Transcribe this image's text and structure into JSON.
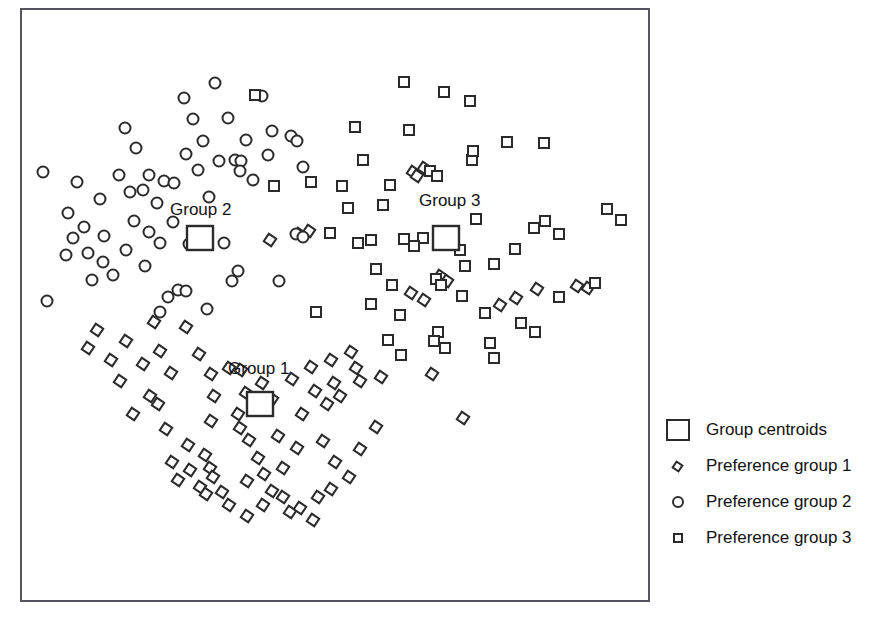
{
  "chart_data": {
    "type": "scatter",
    "title": "",
    "xlabel": "",
    "ylabel": "",
    "grid": false,
    "axis_ticks": false,
    "frame": {
      "x": 20,
      "y": 8,
      "width": 630,
      "height": 594
    },
    "xlim": [
      20,
      650
    ],
    "ylim": [
      8,
      602
    ],
    "marker_colors": {
      "stroke": "#2b2b2b",
      "fill": "#ffffff"
    },
    "annotations": [
      {
        "text": "Group 1",
        "x": 228,
        "y": 368
      },
      {
        "text": "Group 2",
        "x": 170,
        "y": 209
      },
      {
        "text": "Group 3",
        "x": 419,
        "y": 200
      }
    ],
    "legend": {
      "position": "right",
      "entries": [
        {
          "label": "Group centroids",
          "marker": "large-square"
        },
        {
          "label": "Preference group 1",
          "marker": "rotated-square"
        },
        {
          "label": "Preference group 2",
          "marker": "circle"
        },
        {
          "label": "Preference group 3",
          "marker": "square"
        }
      ]
    },
    "series": [
      {
        "name": "Preference group 1",
        "marker": "rotated-square",
        "marker_size": 9,
        "rotation_deg": 34,
        "points": [
          [
            97,
            330
          ],
          [
            126,
            341
          ],
          [
            154,
            322
          ],
          [
            160,
            351
          ],
          [
            186,
            327
          ],
          [
            143,
            364
          ],
          [
            171,
            373
          ],
          [
            199,
            354
          ],
          [
            211,
            374
          ],
          [
            229,
            368
          ],
          [
            241,
            370
          ],
          [
            158,
            404
          ],
          [
            214,
            396
          ],
          [
            246,
            393
          ],
          [
            262,
            383
          ],
          [
            272,
            399
          ],
          [
            292,
            379
          ],
          [
            311,
            367
          ],
          [
            331,
            360
          ],
          [
            351,
            352
          ],
          [
            356,
            368
          ],
          [
            334,
            383
          ],
          [
            340,
            396
          ],
          [
            327,
            404
          ],
          [
            315,
            391
          ],
          [
            360,
            381
          ],
          [
            381,
            377
          ],
          [
            432,
            374
          ],
          [
            463,
            418
          ],
          [
            302,
            414
          ],
          [
            188,
            445
          ],
          [
            205,
            455
          ],
          [
            172,
            462
          ],
          [
            190,
            470
          ],
          [
            210,
            468
          ],
          [
            178,
            480
          ],
          [
            200,
            487
          ],
          [
            213,
            477
          ],
          [
            206,
            494
          ],
          [
            222,
            492
          ],
          [
            229,
            505
          ],
          [
            247,
            516
          ],
          [
            263,
            505
          ],
          [
            272,
            491
          ],
          [
            283,
            497
          ],
          [
            290,
            512
          ],
          [
            300,
            508
          ],
          [
            313,
            520
          ],
          [
            318,
            497
          ],
          [
            331,
            489
          ],
          [
            247,
            481
          ],
          [
            264,
            474
          ],
          [
            283,
            468
          ],
          [
            258,
            458
          ],
          [
            240,
            428
          ],
          [
            278,
            436
          ],
          [
            297,
            448
          ],
          [
            335,
            462
          ],
          [
            349,
            477
          ],
          [
            360,
            449
          ],
          [
            323,
            441
          ],
          [
            249,
            440
          ],
          [
            211,
            421
          ],
          [
            238,
            414
          ],
          [
            166,
            429
          ],
          [
            133,
            414
          ],
          [
            150,
            396
          ],
          [
            120,
            381
          ],
          [
            111,
            360
          ],
          [
            88,
            348
          ],
          [
            500,
            305
          ],
          [
            516,
            298
          ],
          [
            537,
            289
          ],
          [
            577,
            286
          ],
          [
            588,
            288
          ],
          [
            440,
            276
          ],
          [
            447,
            281
          ],
          [
            413,
            172
          ],
          [
            424,
            168
          ],
          [
            417,
            176
          ],
          [
            299,
            234
          ],
          [
            309,
            231
          ],
          [
            270,
            240
          ],
          [
            411,
            293
          ],
          [
            424,
            300
          ],
          [
            376,
            427
          ]
        ]
      },
      {
        "name": "Preference group 2",
        "marker": "circle",
        "marker_size": 11,
        "points": [
          [
            43,
            172
          ],
          [
            77,
            182
          ],
          [
            68,
            213
          ],
          [
            84,
            227
          ],
          [
            100,
            199
          ],
          [
            104,
            236
          ],
          [
            125,
            128
          ],
          [
            136,
            148
          ],
          [
            143,
            190
          ],
          [
            149,
            175
          ],
          [
            157,
            203
          ],
          [
            145,
            266
          ],
          [
            160,
            243
          ],
          [
            173,
            222
          ],
          [
            168,
            297
          ],
          [
            178,
            290
          ],
          [
            186,
            291
          ],
          [
            164,
            181
          ],
          [
            174,
            183
          ],
          [
            186,
            154
          ],
          [
            184,
            98
          ],
          [
            193,
            119
          ],
          [
            198,
            170
          ],
          [
            203,
            141
          ],
          [
            209,
            197
          ],
          [
            215,
            83
          ],
          [
            219,
            161
          ],
          [
            228,
            118
          ],
          [
            235,
            160
          ],
          [
            241,
            161
          ],
          [
            240,
            171
          ],
          [
            246,
            140
          ],
          [
            232,
            281
          ],
          [
            238,
            271
          ],
          [
            253,
            180
          ],
          [
            262,
            96
          ],
          [
            268,
            155
          ],
          [
            272,
            131
          ],
          [
            279,
            281
          ],
          [
            291,
            136
          ],
          [
            297,
            141
          ],
          [
            303,
            167
          ],
          [
            296,
            234
          ],
          [
            303,
            237
          ],
          [
            47,
            301
          ],
          [
            66,
            255
          ],
          [
            92,
            280
          ],
          [
            113,
            275
          ],
          [
            126,
            250
          ],
          [
            160,
            312
          ],
          [
            189,
            244
          ],
          [
            224,
            243
          ],
          [
            207,
            309
          ],
          [
            149,
            232
          ],
          [
            134,
            221
          ],
          [
            103,
            262
          ],
          [
            88,
            253
          ],
          [
            73,
            238
          ],
          [
            119,
            175
          ],
          [
            130,
            192
          ]
        ]
      },
      {
        "name": "Preference group 3",
        "marker": "square",
        "marker_size": 10,
        "points": [
          [
            255,
            95
          ],
          [
            404,
            82
          ],
          [
            444,
            92
          ],
          [
            470,
            101
          ],
          [
            355,
            127
          ],
          [
            363,
            160
          ],
          [
            409,
            130
          ],
          [
            430,
            171
          ],
          [
            437,
            176
          ],
          [
            472,
            160
          ],
          [
            473,
            151
          ],
          [
            507,
            142
          ],
          [
            544,
            143
          ],
          [
            348,
            208
          ],
          [
            383,
            205
          ],
          [
            404,
            239
          ],
          [
            423,
            238
          ],
          [
            445,
            240
          ],
          [
            460,
            250
          ],
          [
            465,
            266
          ],
          [
            476,
            219
          ],
          [
            494,
            264
          ],
          [
            515,
            249
          ],
          [
            534,
            228
          ],
          [
            545,
            221
          ],
          [
            559,
            234
          ],
          [
            607,
            209
          ],
          [
            621,
            220
          ],
          [
            595,
            283
          ],
          [
            316,
            312
          ],
          [
            371,
            304
          ],
          [
            392,
            285
          ],
          [
            400,
            315
          ],
          [
            438,
            332
          ],
          [
            445,
            348
          ],
          [
            462,
            296
          ],
          [
            485,
            313
          ],
          [
            490,
            343
          ],
          [
            494,
            358
          ],
          [
            401,
            355
          ],
          [
            434,
            341
          ],
          [
            521,
            323
          ],
          [
            535,
            332
          ],
          [
            559,
            297
          ],
          [
            436,
            279
          ],
          [
            441,
            285
          ],
          [
            390,
            185
          ],
          [
            330,
            233
          ],
          [
            342,
            186
          ],
          [
            376,
            269
          ],
          [
            358,
            243
          ],
          [
            371,
            240
          ],
          [
            311,
            182
          ],
          [
            274,
            186
          ],
          [
            388,
            340
          ],
          [
            414,
            246
          ]
        ]
      },
      {
        "name": "Group centroids",
        "marker": "large-square",
        "points": [
          [
            260,
            404
          ],
          [
            200,
            238
          ],
          [
            446,
            238
          ]
        ]
      }
    ]
  }
}
